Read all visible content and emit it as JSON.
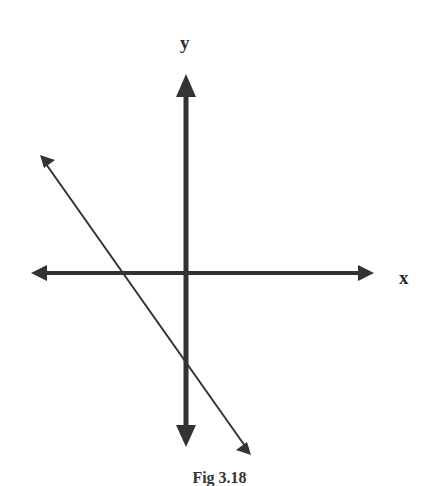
{
  "diagram": {
    "type": "coordinate-axes-with-line",
    "colors": {
      "background": "#ffffff",
      "axis": "#333333",
      "line": "#333333",
      "label": "#2a2a2a"
    },
    "axes": {
      "x_label": "x",
      "y_label": "y",
      "origin_px": [
        186,
        273
      ],
      "x_axis_px": {
        "from": [
          31,
          273
        ],
        "to": [
          374,
          273
        ]
      },
      "y_axis_px": {
        "from": [
          186,
          74
        ],
        "to": [
          186,
          447
        ]
      }
    },
    "line": {
      "from_px": [
        40,
        155
      ],
      "to_px": [
        251,
        455
      ],
      "direction": "negative slope",
      "crosses_x_axis_px": [
        123,
        273
      ],
      "crosses_y_axis_px": [
        186,
        360
      ],
      "description": "Line with negative slope and negative x-intercept and negative y-intercept"
    },
    "caption": "Fig 3.18"
  }
}
